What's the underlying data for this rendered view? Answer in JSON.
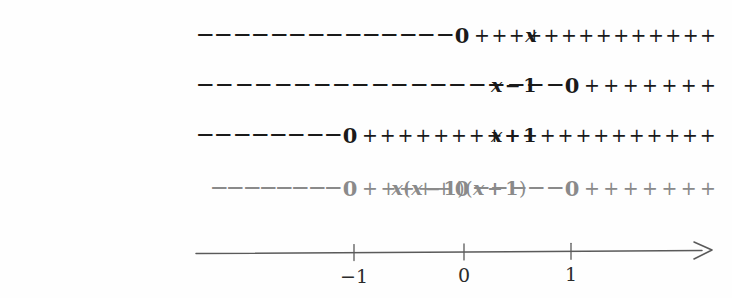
{
  "diagram": {
    "type": "sign-chart",
    "colors": {
      "ink": "#1a1a1a",
      "muted": "#8a8a8a",
      "background": "#fefefe"
    },
    "symbols": {
      "minus": "−",
      "plus": "+",
      "zero": "0"
    },
    "rows": [
      {
        "id": "row-x",
        "label_parts": [
          {
            "text": "x",
            "kind": "var"
          }
        ],
        "label_text": "x",
        "color": "dark",
        "label_right_px": 537,
        "track_left_px": 198,
        "track_right_px": 715,
        "zeros": [
          {
            "value": 0,
            "x_px": 462
          }
        ],
        "segments": [
          {
            "sign": "−",
            "count": 14,
            "from_px": 198,
            "to_px": 452
          },
          {
            "sign": "+",
            "count": 14,
            "from_px": 474,
            "to_px": 716
          }
        ]
      },
      {
        "id": "row-x-minus-1",
        "label_parts": [
          {
            "text": "x",
            "kind": "var"
          },
          {
            "text": "−",
            "kind": "op"
          },
          {
            "text": "1",
            "kind": "num"
          }
        ],
        "label_text": "x − 1",
        "color": "dark",
        "label_right_px": 537,
        "track_left_px": 198,
        "track_right_px": 715,
        "zeros": [
          {
            "value": 1,
            "x_px": 572
          }
        ],
        "segments": [
          {
            "sign": "−",
            "count": 19,
            "from_px": 198,
            "to_px": 562
          },
          {
            "sign": "+",
            "count": 7,
            "from_px": 584,
            "to_px": 716
          }
        ]
      },
      {
        "id": "row-x-plus-1",
        "label_parts": [
          {
            "text": "x",
            "kind": "var"
          },
          {
            "text": "+",
            "kind": "op"
          },
          {
            "text": "1",
            "kind": "num"
          }
        ],
        "label_text": "x + 1",
        "color": "dark",
        "label_right_px": 537,
        "track_left_px": 198,
        "track_right_px": 715,
        "zeros": [
          {
            "value": -1,
            "x_px": 350
          }
        ],
        "segments": [
          {
            "sign": "−",
            "count": 8,
            "from_px": 198,
            "to_px": 340
          },
          {
            "sign": "+",
            "count": 20,
            "from_px": 362,
            "to_px": 716
          }
        ]
      },
      {
        "id": "row-product",
        "label_parts": [
          {
            "text": "x",
            "kind": "var"
          },
          {
            "text": "(",
            "kind": "paren"
          },
          {
            "text": "x",
            "kind": "var"
          },
          {
            "text": "−",
            "kind": "op"
          },
          {
            "text": "1",
            "kind": "num"
          },
          {
            "text": ")",
            "kind": "paren"
          },
          {
            "text": "(",
            "kind": "paren"
          },
          {
            "text": "x",
            "kind": "var"
          },
          {
            "text": "+",
            "kind": "op"
          },
          {
            "text": "1",
            "kind": "num"
          },
          {
            "text": ")",
            "kind": "paren"
          }
        ],
        "label_text": "x (x − 1) (x + 1)",
        "color": "gray",
        "label_right_px": 527,
        "track_left_px": 212,
        "track_right_px": 715,
        "zeros": [
          {
            "value": -1,
            "x_px": 350
          },
          {
            "value": 0,
            "x_px": 462
          },
          {
            "value": 1,
            "x_px": 572
          }
        ],
        "segments": [
          {
            "sign": "−",
            "count": 8,
            "from_px": 212,
            "to_px": 340
          },
          {
            "sign": "+",
            "count": 5,
            "from_px": 362,
            "to_px": 452
          },
          {
            "sign": "−",
            "count": 5,
            "from_px": 474,
            "to_px": 562
          },
          {
            "sign": "+",
            "count": 7,
            "from_px": 584,
            "to_px": 716
          }
        ]
      }
    ],
    "axis": {
      "label": "number-line",
      "start_px": 196,
      "end_px": 712,
      "y_px": 252,
      "color": "#5a5a5a",
      "arrow": "right",
      "ticks": [
        {
          "label": "−1",
          "value": -1,
          "x_px": 354
        },
        {
          "label": "0",
          "value": 0,
          "x_px": 464
        },
        {
          "label": "1",
          "value": 1,
          "x_px": 571
        }
      ]
    }
  }
}
